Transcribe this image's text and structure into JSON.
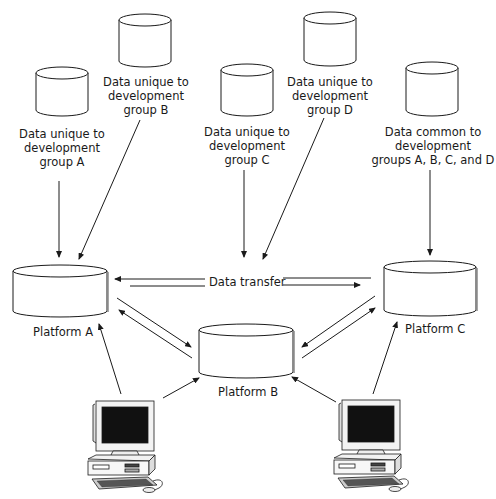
{
  "data_stores": [
    {
      "id": "A",
      "label": "Data unique to\ndevelopment\ngroup A"
    },
    {
      "id": "B",
      "label": "Data unique to\ndevelopment\ngroup B"
    },
    {
      "id": "C",
      "label": "Data unique to\ndevelopment\ngroup C"
    },
    {
      "id": "D",
      "label": "Data unique to\ndevelopment\ngroup D"
    },
    {
      "id": "common",
      "label": "Data common to\ndevelopment\ngroups A, B, C, and D"
    }
  ],
  "platforms": [
    {
      "id": "A",
      "label": "Platform A"
    },
    {
      "id": "B",
      "label": "Platform B"
    },
    {
      "id": "C",
      "label": "Platform C"
    }
  ],
  "connections": {
    "data_transfer_label": "Data transfer"
  },
  "workstations": [
    {
      "id": "left",
      "icon": "desktop-computer-icon"
    },
    {
      "id": "right",
      "icon": "desktop-computer-icon"
    }
  ],
  "colors": {
    "stroke": "#1a1a1a",
    "background": "#ffffff"
  }
}
